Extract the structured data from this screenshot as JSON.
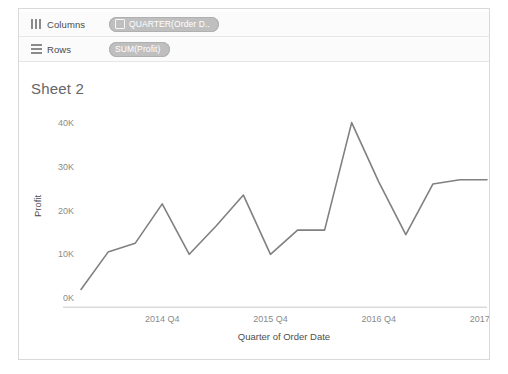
{
  "window": {
    "background": "#ffffff",
    "frame_border": "#d9d9d9"
  },
  "shelves": [
    {
      "id": "columns",
      "icon": "columns-icon",
      "label": "Columns",
      "pill_label": "QUARTER(Order D..",
      "pill_glyph": "calendar-icon",
      "pill_color": "#bfbfbf"
    },
    {
      "id": "rows",
      "icon": "rows-icon",
      "label": "Rows",
      "pill_label": "SUM(Profit)",
      "pill_glyph": "",
      "pill_color": "#bfbfbf"
    }
  ],
  "view": {
    "sheet_title": "Sheet 2"
  },
  "chart_data": {
    "type": "line",
    "title": "Sheet 2",
    "xlabel": "Quarter of Order Date",
    "ylabel": "Profit",
    "line_color": "#808080",
    "grid": false,
    "legend": "none",
    "ylim": [
      0,
      42000
    ],
    "yticks": [
      0,
      10000,
      20000,
      30000,
      40000
    ],
    "ytick_labels": [
      "0K",
      "10K",
      "20K",
      "30K",
      "40K"
    ],
    "xticks": [
      "2014 Q4",
      "2015 Q4",
      "2016 Q4",
      "2017 Q4"
    ],
    "xtick_labels": [
      "2014 Q4",
      "2015 Q4",
      "2016 Q4",
      "2017 Q4"
    ],
    "x": [
      "2014 Q1",
      "2014 Q2",
      "2014 Q3",
      "2014 Q4",
      "2015 Q1",
      "2015 Q2",
      "2015 Q3",
      "2015 Q4",
      "2016 Q1",
      "2016 Q2",
      "2016 Q3",
      "2016 Q4",
      "2017 Q1",
      "2017 Q2",
      "2017 Q3",
      "2017 Q4"
    ],
    "values": [
      2000,
      10500,
      12500,
      21500,
      10000,
      16500,
      23500,
      10000,
      15500,
      15500,
      40000,
      26500,
      14500,
      26000,
      27000,
      27000
    ],
    "series": [
      {
        "name": "SUM(Profit)",
        "values": [
          2000,
          10500,
          12500,
          21500,
          10000,
          16500,
          23500,
          10000,
          15500,
          15500,
          40000,
          26500,
          14500,
          26000,
          27000,
          27000
        ]
      }
    ]
  }
}
